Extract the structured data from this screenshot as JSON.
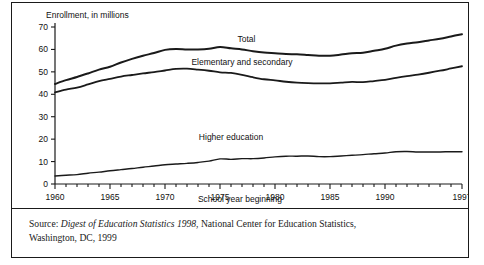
{
  "figure": {
    "source_prefix": "Source: ",
    "source_title": "Digest of Education Statistics 1998",
    "source_rest": ", National Center for Education Statistics,",
    "source_line2": "Washington, DC, 1999"
  },
  "chart_data": {
    "type": "line",
    "title": "",
    "ylabel": "Enrollment, in millions",
    "xlabel": "School year beginning",
    "xlim": [
      1960,
      1997
    ],
    "ylim": [
      0,
      70
    ],
    "yticks": [
      0,
      10,
      20,
      30,
      40,
      50,
      60,
      70
    ],
    "ytick_labels": [
      "0",
      "10",
      "20",
      "30",
      "40",
      "50",
      "60",
      "70"
    ],
    "xticks": [
      1960,
      1965,
      1970,
      1975,
      1980,
      1985,
      1990,
      1997
    ],
    "xtick_labels": [
      "1960",
      "1965",
      "1970",
      "1975",
      "1980",
      "1985",
      "1990",
      "1997"
    ],
    "minor_xtick_interval": 1,
    "grid": false,
    "legend": "inline-labels",
    "x": [
      1960,
      1961,
      1962,
      1963,
      1964,
      1965,
      1966,
      1967,
      1968,
      1969,
      1970,
      1971,
      1972,
      1973,
      1974,
      1975,
      1976,
      1977,
      1978,
      1979,
      1980,
      1981,
      1982,
      1983,
      1984,
      1985,
      1986,
      1987,
      1988,
      1989,
      1990,
      1991,
      1992,
      1993,
      1994,
      1995,
      1996,
      1997
    ],
    "series": [
      {
        "name": "Total",
        "label": "Total",
        "label_x": 1977.4,
        "label_y": 63.5,
        "values": [
          44.6,
          46.3,
          47.7,
          49.3,
          51.0,
          52.3,
          54.2,
          55.8,
          57.2,
          58.4,
          59.8,
          60.2,
          60.0,
          60.0,
          60.3,
          61.1,
          60.5,
          60.0,
          59.2,
          58.6,
          58.3,
          58.0,
          57.8,
          57.5,
          57.2,
          57.2,
          57.7,
          58.3,
          58.5,
          59.4,
          60.3,
          61.7,
          62.6,
          63.2,
          64.0,
          64.8,
          65.8,
          66.8
        ],
        "color": "#1a1a1a",
        "linewidth": 2.0
      },
      {
        "name": "Elementary and secondary",
        "label": "Elementary and secondary",
        "label_x": 1977.0,
        "label_y": 53.0,
        "values": [
          40.9,
          42.1,
          43.0,
          44.4,
          45.9,
          46.9,
          47.9,
          48.6,
          49.3,
          49.9,
          50.6,
          51.3,
          51.4,
          51.0,
          50.5,
          49.8,
          49.5,
          48.7,
          47.6,
          46.7,
          46.2,
          45.6,
          45.2,
          45.0,
          44.9,
          44.9,
          45.2,
          45.5,
          45.4,
          45.9,
          46.4,
          47.3,
          48.1,
          48.8,
          49.6,
          50.5,
          51.5,
          52.5
        ],
        "color": "#1a1a1a",
        "linewidth": 1.8
      },
      {
        "name": "Higher education",
        "label": "Higher education",
        "label_x": 1976.0,
        "label_y": 19.5,
        "values": [
          3.6,
          3.9,
          4.2,
          4.8,
          5.3,
          5.9,
          6.4,
          6.9,
          7.5,
          8.0,
          8.6,
          8.9,
          9.2,
          9.6,
          10.2,
          11.2,
          11.0,
          11.3,
          11.3,
          11.6,
          12.1,
          12.4,
          12.4,
          12.5,
          12.2,
          12.2,
          12.5,
          12.8,
          13.1,
          13.5,
          13.8,
          14.4,
          14.5,
          14.3,
          14.3,
          14.3,
          14.4,
          14.4
        ],
        "color": "#1a1a1a",
        "linewidth": 1.4
      }
    ]
  }
}
